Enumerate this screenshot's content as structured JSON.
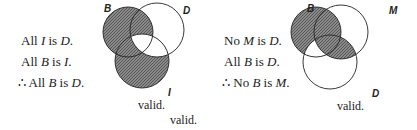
{
  "left": {
    "premises": [
      {
        "pre": "All ",
        "a": "I",
        "mid": " is ",
        "b": "D",
        "post": "."
      },
      {
        "pre": "All ",
        "a": "B",
        "mid": " is ",
        "b": "I",
        "post": "."
      },
      {
        "pre": "∴ All ",
        "a": "B",
        "mid": " is ",
        "b": "D",
        "post": "."
      }
    ],
    "labels": {
      "b": "B",
      "d": "D",
      "i": "I"
    },
    "verdict": "valid."
  },
  "right": {
    "premises": [
      {
        "pre": "No ",
        "a": "M",
        "mid": " is ",
        "b": "D",
        "post": "."
      },
      {
        "pre": "All ",
        "a": "B",
        "mid": " is ",
        "b": "D",
        "post": "."
      },
      {
        "pre": "∴ No ",
        "a": "B",
        "mid": " is ",
        "b": "M",
        "post": "."
      }
    ],
    "labels": {
      "b": "B",
      "m": "M",
      "d": "D"
    },
    "verdict": "valid."
  },
  "extra_verdict": "valid."
}
